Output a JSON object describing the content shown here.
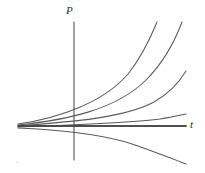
{
  "figure": {
    "title": "",
    "background_color": "#ffffff",
    "width": 205,
    "height": 173
  },
  "axes": {
    "vertical": {
      "label": "P",
      "name": "population-axis",
      "x": 74,
      "y_top": 22,
      "y_bottom": 160,
      "color": "#555555"
    },
    "horizontal": {
      "label": "t",
      "name": "time-axis",
      "y": 126,
      "x_left": 18,
      "x_right": 186,
      "color": "#444444"
    }
  },
  "chart_data": {
    "type": "line",
    "title": "",
    "xlabel": "t",
    "ylabel": "P",
    "grid": false,
    "legend": null,
    "xlim": [
      18,
      186
    ],
    "ylim": [
      22,
      165
    ],
    "common_origin": {
      "x": 18,
      "y": 126
    },
    "series": [
      {
        "name": "steepest-growth-curve",
        "style": "solid",
        "color": "#5a5a5a",
        "path": "M 18 124 C 60 118, 104 102, 128 74 C 144 54, 152 34, 157 22"
      },
      {
        "name": "fast-growth-curve",
        "style": "solid",
        "color": "#5a5a5a",
        "path": "M 18 125 C 66 120, 116 110, 146 80 C 164 62, 176 38, 182 22"
      },
      {
        "name": "moderate-growth-curve",
        "style": "solid",
        "color": "#5a5a5a",
        "path": "M 18 126 C 70 122, 124 118, 154 102 C 170 93, 180 81, 186 71"
      },
      {
        "name": "slow-growth-curve",
        "style": "solid",
        "color": "#5a5a5a",
        "path": "M 18 127 C 74 125, 130 123, 160 119 C 172 117, 181 115, 186 114"
      },
      {
        "name": "equilibrium-line",
        "style": "solid",
        "color": "#444444",
        "path": "M 18 126 L 186 126"
      },
      {
        "name": "decay-curve",
        "style": "solid",
        "color": "#5a5a5a",
        "path": "M 18 128 C 62 130, 106 134, 138 146 C 160 154, 176 160, 186 164"
      }
    ]
  },
  "artifacts": {
    "speck": "scan-speck"
  }
}
